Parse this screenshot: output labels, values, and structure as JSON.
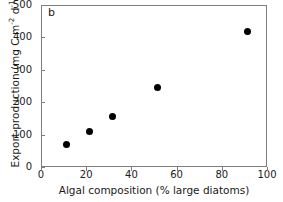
{
  "chart_data": {
    "type": "scatter",
    "title": "",
    "panel_label": "b",
    "xlabel": "Algal composition (% large diatoms)",
    "ylabel_text": "Export production (mg C m",
    "ylabel_sup1": "-2",
    "ylabel_mid": " d",
    "ylabel_sup2": "-1",
    "ylabel_close": ")",
    "ylabel_full": "Export production (mg C m-2 d-1)",
    "xlim": [
      0,
      100
    ],
    "ylim": [
      0,
      500
    ],
    "xticks": [
      "0",
      "20",
      "40",
      "60",
      "80",
      "100"
    ],
    "xtick_values": [
      0,
      20,
      40,
      60,
      80,
      100
    ],
    "yticks": [
      "0",
      "100",
      "200",
      "300",
      "400",
      "500"
    ],
    "ytick_values": [
      0,
      100,
      200,
      300,
      400,
      500
    ],
    "grid": false,
    "legend": false,
    "marker": "filled-circle",
    "marker_color": "#000000",
    "frame_color": "#7d7d7d",
    "points": [
      {
        "x": 11,
        "y": 71
      },
      {
        "x": 21,
        "y": 114
      },
      {
        "x": 31,
        "y": 160
      },
      {
        "x": 51,
        "y": 247
      },
      {
        "x": 91,
        "y": 420
      }
    ]
  }
}
